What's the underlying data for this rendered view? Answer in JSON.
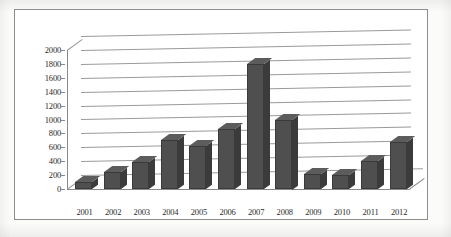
{
  "chart_data": {
    "type": "bar",
    "title": "",
    "subtitle": "",
    "xlabel": "",
    "ylabel": "",
    "categories": [
      "2001",
      "2002",
      "2003",
      "2004",
      "2005",
      "2006",
      "2007",
      "2008",
      "2009",
      "2010",
      "2011",
      "2012"
    ],
    "values": [
      100,
      250,
      390,
      700,
      620,
      860,
      1800,
      1000,
      210,
      200,
      400,
      670
    ],
    "series": [
      {
        "name": "",
        "values": [
          100,
          250,
          390,
          700,
          620,
          860,
          1800,
          1000,
          210,
          200,
          400,
          670
        ]
      }
    ],
    "ylim": [
      0,
      2000
    ],
    "ytick_values": [
      0,
      200,
      400,
      600,
      800,
      1000,
      1200,
      1400,
      1600,
      1800,
      2000
    ],
    "ytick_labels": [
      "0",
      "200",
      "400",
      "600",
      "800",
      "1000",
      "1200",
      "1400",
      "1600",
      "1800",
      "2000"
    ],
    "grid": true,
    "legend": false,
    "legend_position": "none",
    "three_d": true,
    "bar_color": "#4f4f4f",
    "bar_side_color": "#3b3b3b",
    "bar_top_color": "#5c5c5c",
    "gridline_color": "#9a9a9a",
    "axis_color": "#8a8a8a",
    "frame_color": "#8d8d8d",
    "background": "#ffffff",
    "annotations": []
  }
}
